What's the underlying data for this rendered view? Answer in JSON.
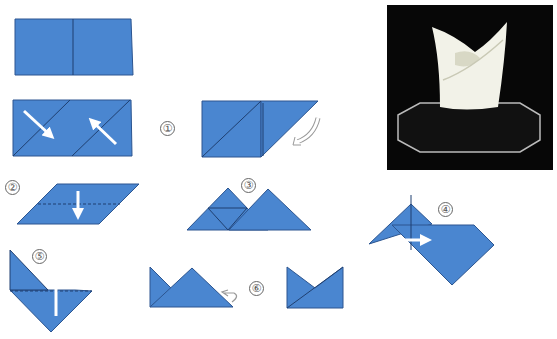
{
  "colors": {
    "paper": "#4a86d0",
    "paper_dark": "#3a6fb8",
    "line": "#1f3f70",
    "arrow": "#ffffff",
    "photo_bg": "#0a0a0a"
  },
  "steps": [
    {
      "label": "①"
    },
    {
      "label": "②"
    },
    {
      "label": "③"
    },
    {
      "label": "④"
    },
    {
      "label": "⑤"
    },
    {
      "label": "⑥"
    }
  ],
  "photo": {
    "alt": "Folded white napkin in a bishop's mitre shape on a black octagonal stand"
  }
}
